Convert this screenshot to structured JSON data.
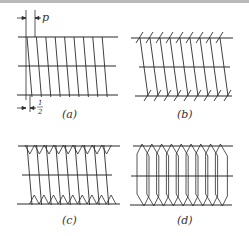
{
  "figure": {
    "stroke_color": "#2b2b2b",
    "background": "#ffffff",
    "panels": [
      {
        "id": "a",
        "label": "(a)",
        "style": "plain-helix"
      },
      {
        "id": "b",
        "label": "(b)",
        "style": "ticked-helix"
      },
      {
        "id": "c",
        "label": "(c)",
        "style": "zigzag-ends"
      },
      {
        "id": "d",
        "label": "(d)",
        "style": "looped-ends"
      }
    ],
    "annotations": {
      "pitch_symbol": "p",
      "half_pitch_numerator": "1",
      "half_pitch_denominator": "2"
    }
  }
}
